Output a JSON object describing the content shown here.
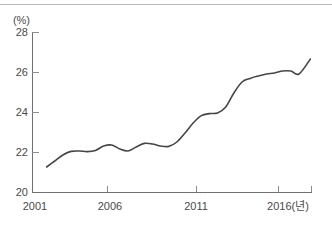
{
  "chart_data": {
    "type": "line",
    "title": "",
    "xlabel": "",
    "ylabel": "",
    "unit_label": "(%)",
    "x_axis_suffix_label": "2016(년)",
    "grid": false,
    "legend": null,
    "xlim": [
      2001,
      2018.2
    ],
    "ylim": [
      20,
      28
    ],
    "y_ticks": [
      20,
      22,
      24,
      26,
      28
    ],
    "y_tick_labels": [
      "20",
      "22",
      "24",
      "26",
      "28"
    ],
    "x_ticks": [
      2001,
      2006,
      2011,
      2016
    ],
    "x_tick_labels": [
      "2001",
      "2006",
      "2011",
      "2016(년)"
    ],
    "series": [
      {
        "name": "series-1",
        "color": "#44464a",
        "x": [
          2001.9,
          2002.4,
          2002.9,
          2003.4,
          2003.9,
          2004.4,
          2004.9,
          2005.4,
          2005.9,
          2006.4,
          2006.9,
          2007.4,
          2007.9,
          2008.4,
          2008.9,
          2009.4,
          2009.9,
          2010.4,
          2010.9,
          2011.4,
          2011.9,
          2012.4,
          2012.9,
          2013.4,
          2013.9,
          2014.4,
          2014.9,
          2015.4,
          2015.9,
          2016.4,
          2016.9,
          2017.4,
          2018.1
        ],
        "values": [
          21.25,
          21.55,
          21.85,
          22.03,
          22.05,
          22.02,
          22.08,
          22.3,
          22.35,
          22.15,
          22.05,
          22.25,
          22.43,
          22.4,
          22.3,
          22.28,
          22.5,
          22.95,
          23.45,
          23.82,
          23.92,
          23.95,
          24.25,
          24.95,
          25.5,
          25.68,
          25.8,
          25.9,
          25.95,
          26.05,
          26.05,
          25.9,
          26.65
        ]
      }
    ],
    "colors": {
      "line": "#44464a",
      "axis": "#6f6f6f",
      "tick": "#8c8c8c",
      "text": "#4a4a4a",
      "background": "#ffffff",
      "top_rule": "#b9b9b9"
    }
  },
  "labels": {
    "unit": "(%)",
    "y": {
      "t20": "20",
      "t22": "22",
      "t24": "24",
      "t26": "26",
      "t28": "28"
    },
    "x": {
      "t2001": "2001",
      "t2006": "2006",
      "t2011": "2011",
      "t2016": "2016(년)"
    }
  }
}
